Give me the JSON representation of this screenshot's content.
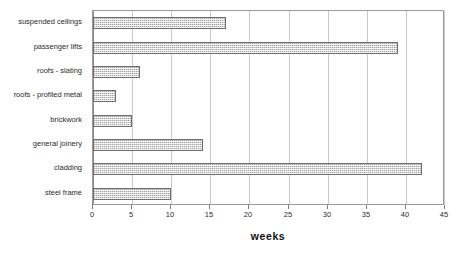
{
  "chart_data": {
    "type": "bar",
    "orientation": "horizontal",
    "title": "",
    "xlabel": "weeks",
    "ylabel": "",
    "xlim": [
      0,
      45
    ],
    "xticks": [
      0,
      5,
      10,
      15,
      20,
      25,
      30,
      35,
      40,
      45
    ],
    "xtick_labels": [
      "0",
      "5",
      "10",
      "15",
      "20",
      "25",
      "30",
      "35",
      "40",
      "45"
    ],
    "grid": true,
    "legend": "none",
    "categories": [
      "suspended ceilings",
      "passenger lifts",
      "roofs - slating",
      "roofs - profiled metal",
      "brickwork",
      "general joinery",
      "cladding",
      "steel frame"
    ],
    "values": [
      17,
      39,
      6,
      3,
      5,
      14,
      42,
      10
    ],
    "series": [
      {
        "name": "weeks",
        "values": [
          17,
          39,
          6,
          3,
          5,
          14,
          42,
          10
        ]
      }
    ],
    "colors": {
      "bar_fill": "#d8d8d8",
      "bar_border": "#6e6e6e",
      "gridline": "#c9c9c9",
      "axis": "#9a9a9a",
      "text": "#2b2b2b",
      "background": "#ffffff"
    }
  }
}
